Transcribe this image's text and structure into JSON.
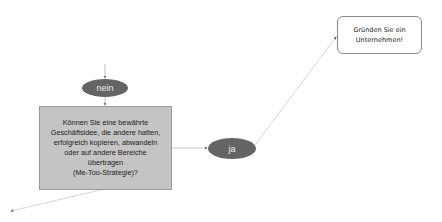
{
  "diagram": {
    "type": "flowchart",
    "nodes": {
      "nein": {
        "label": "nein",
        "shape": "ellipse",
        "color": "#646464"
      },
      "question": {
        "label": "Können Sie eine bewährte\nGeschäftsidee, die andere hatten,\nerfolgreich kopieren, abwandeln\noder auf andere Bereiche\nübertragen\n(Me-Too-Strategie)?",
        "shape": "rectangle",
        "color": "#c4c4c4"
      },
      "ja": {
        "label": "ja",
        "shape": "ellipse",
        "color": "#646464"
      },
      "result": {
        "label": "Gründen Sie ein\nUnternehmen!",
        "shape": "rounded-rectangle",
        "color": "#ffffff"
      }
    },
    "edges": [
      {
        "from": "above",
        "to": "nein"
      },
      {
        "from": "nein",
        "to": "question"
      },
      {
        "from": "question",
        "to": "ja"
      },
      {
        "from": "ja",
        "to": "result"
      },
      {
        "from": "question",
        "to": "below-left"
      }
    ]
  }
}
